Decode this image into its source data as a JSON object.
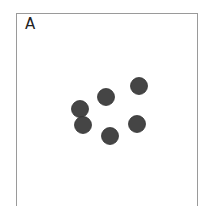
{
  "panel": {
    "label": "A"
  },
  "dots": {
    "color": "#454545",
    "stroke": "#333333",
    "radius": 8.5,
    "points": [
      {
        "x": 139,
        "y": 86
      },
      {
        "x": 106,
        "y": 97
      },
      {
        "x": 80,
        "y": 109
      },
      {
        "x": 83,
        "y": 125
      },
      {
        "x": 110,
        "y": 136
      },
      {
        "x": 137,
        "y": 124
      }
    ]
  }
}
